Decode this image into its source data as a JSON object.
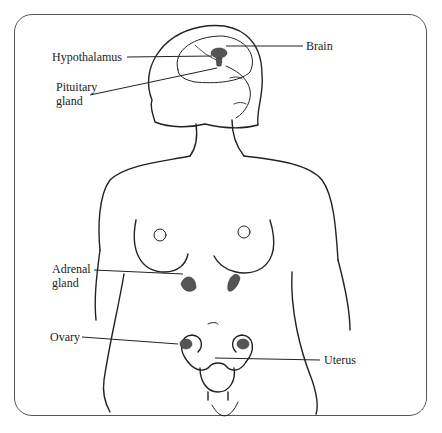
{
  "diagram": {
    "labels": {
      "hypothalamus": "Hypothalamus",
      "brain": "Brain",
      "pituitary_line1": "Pituitary",
      "pituitary_line2": "gland",
      "adrenal_line1": "Adrenal",
      "adrenal_line2": "gland",
      "ovary": "Ovary",
      "uterus": "Uterus"
    },
    "colors": {
      "line": "#222222",
      "organ_fill": "#555555",
      "frame": "#555555"
    }
  }
}
